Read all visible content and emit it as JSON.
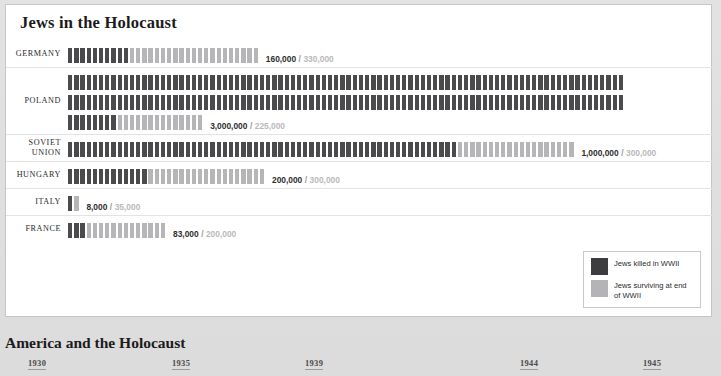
{
  "card": {
    "title": "Jews in the Holocaust"
  },
  "legend": {
    "killed_label": "Jews killed in WWII",
    "surviving_label": "Jews surviving at end of WWII",
    "killed_color": "#3d3d3f",
    "surviving_color": "#b4b4b6"
  },
  "bottom": {
    "title": "America and the Holocaust"
  },
  "separator": "/",
  "chart_data": {
    "type": "bar",
    "subtype": "pictogram-isotype",
    "title": "Jews in the Holocaust",
    "xlabel": "",
    "ylabel": "",
    "unit_per_figure": 100000,
    "legend_position": "bottom-right",
    "grid": false,
    "categories": [
      "GERMANY",
      "POLAND",
      "SOVIET UNION",
      "HUNGARY",
      "ITALY",
      "FRANCE"
    ],
    "series": [
      {
        "name": "Jews killed in WWII",
        "color": "#4b4b4d",
        "values": [
          160000,
          3000000,
          1000000,
          200000,
          8000,
          83000
        ]
      },
      {
        "name": "Jews surviving at end of WWII",
        "color": "#b6b6b8",
        "values": [
          330000,
          225000,
          300000,
          300000,
          35000,
          200000
        ]
      }
    ],
    "rows": [
      {
        "country": "GERMANY",
        "killed": 160000,
        "surviving": 330000,
        "killed_text": "160,000",
        "surviving_text": "330,000",
        "killed_figures": 10,
        "surviving_figures": 21,
        "lines": 1
      },
      {
        "country": "POLAND",
        "killed": 3000000,
        "surviving": 225000,
        "killed_text": "3,000,000",
        "surviving_text": "225,000",
        "killed_figures": 188,
        "surviving_figures": 14,
        "lines": 3
      },
      {
        "country": "SOVIET UNION",
        "killed": 1000000,
        "surviving": 300000,
        "killed_text": "1,000,000",
        "surviving_text": "300,000",
        "killed_figures": 63,
        "surviving_figures": 19,
        "lines": 1
      },
      {
        "country": "HUNGARY",
        "killed": 200000,
        "surviving": 300000,
        "killed_text": "200,000",
        "surviving_text": "300,000",
        "killed_figures": 13,
        "surviving_figures": 19,
        "lines": 1
      },
      {
        "country": "ITALY",
        "killed": 8000,
        "surviving": 35000,
        "killed_text": "8,000",
        "surviving_text": "35,000",
        "killed_figures": 1,
        "surviving_figures": 1,
        "lines": 1
      },
      {
        "country": "FRANCE",
        "killed": 83000,
        "surviving": 200000,
        "killed_text": "83,000",
        "surviving_text": "200,000",
        "killed_figures": 3,
        "surviving_figures": 13,
        "lines": 1
      }
    ]
  },
  "timeline": {
    "ticks": [
      {
        "year": "1930",
        "x": 28
      },
      {
        "year": "1935",
        "x": 172
      },
      {
        "year": "1939",
        "x": 305
      },
      {
        "year": "1944",
        "x": 520
      },
      {
        "year": "1945",
        "x": 643
      }
    ]
  }
}
